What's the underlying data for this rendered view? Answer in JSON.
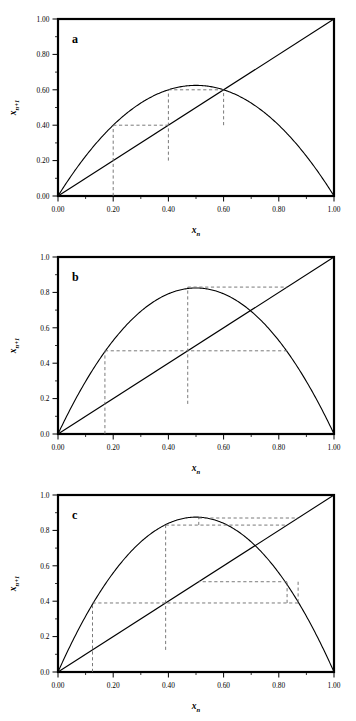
{
  "figure": {
    "type": "logistic-map-cobweb-figure",
    "panel_count": 3,
    "background": "#ffffff",
    "line_color": "#000000",
    "dash_color": "#6b6b6b"
  },
  "axes": {
    "x_title": "x",
    "x_sub": "n",
    "y_title": "x",
    "y_sub": "n+1",
    "xlim": [
      0,
      1
    ],
    "ylim": [
      0,
      1
    ],
    "x_ticks": [
      0,
      0.2,
      0.4,
      0.6,
      0.8,
      1
    ],
    "x_tick_labels": [
      "0.00",
      "0.20",
      "0.40",
      "0.60",
      "0.80",
      "1.00"
    ],
    "minor_ticks_per_interval": 2,
    "grid": false
  },
  "panels": [
    {
      "letter": "a",
      "y_tick_labels": [
        "0.00",
        "0.20",
        "0.40",
        "0.60",
        "0.80",
        "1.00"
      ],
      "y_ticks": [
        0,
        0.2,
        0.4,
        0.6,
        0.8,
        1
      ],
      "r": 2.5,
      "peak": 0.625,
      "fixed_point": 0.6,
      "x0": 0.2,
      "orbit": [
        0.2,
        0.4,
        0.6,
        0.6
      ],
      "behavior": "convergence to fixed point"
    },
    {
      "letter": "b",
      "y_tick_labels": [
        "0.0",
        "0.2",
        "0.4",
        "0.6",
        "0.8",
        "1.0"
      ],
      "y_ticks": [
        0,
        0.2,
        0.4,
        0.6,
        0.8,
        1
      ],
      "r": 3.3,
      "peak": 0.825,
      "fixed_point": 0.697,
      "x0": 0.17,
      "orbit": [
        0.17,
        0.47,
        0.83,
        0.47
      ],
      "behavior": "period-2 cycle"
    },
    {
      "letter": "c",
      "y_tick_labels": [
        "0.0",
        "0.2",
        "0.4",
        "0.6",
        "0.8",
        "1.0"
      ],
      "y_ticks": [
        0,
        0.2,
        0.4,
        0.6,
        0.8,
        1
      ],
      "r": 3.5,
      "peak": 0.875,
      "fixed_point": 0.714,
      "x0": 0.125,
      "orbit": [
        0.125,
        0.39,
        0.83,
        0.51,
        0.87,
        0.39
      ],
      "behavior": "period-4 cycle"
    }
  ],
  "chart_data": {
    "type": "line",
    "title": "",
    "xlabel": "x_n",
    "ylabel": "x_n+1",
    "xlim": [
      0,
      1
    ],
    "ylim": [
      0,
      1
    ],
    "grid": false,
    "legend": "none",
    "subplots": [
      {
        "label": "a",
        "r": 2.5,
        "series": [
          {
            "name": "logistic map f(x)=2.5x(1-x)",
            "kind": "parabola",
            "peak_x": 0.5,
            "peak_y": 0.625
          },
          {
            "name": "identity y=x",
            "kind": "diagonal",
            "x": [
              0,
              1
            ],
            "y": [
              0,
              1
            ]
          },
          {
            "name": "cobweb",
            "kind": "dashed-staircase",
            "x_sequence": [
              0.2,
              0.4,
              0.6
            ],
            "y_sequence": [
              0.4,
              0.6,
              0.6
            ]
          }
        ],
        "x_tick_labels": [
          "0.00",
          "0.20",
          "0.40",
          "0.60",
          "0.80",
          "1.00"
        ],
        "y_tick_labels": [
          "0.00",
          "0.20",
          "0.40",
          "0.60",
          "0.80",
          "1.00"
        ]
      },
      {
        "label": "b",
        "r": 3.3,
        "series": [
          {
            "name": "logistic map f(x)=3.3x(1-x)",
            "kind": "parabola",
            "peak_x": 0.5,
            "peak_y": 0.825
          },
          {
            "name": "identity y=x",
            "kind": "diagonal",
            "x": [
              0,
              1
            ],
            "y": [
              0,
              1
            ]
          },
          {
            "name": "cobweb",
            "kind": "dashed-staircase",
            "x_sequence": [
              0.17,
              0.47,
              0.83,
              0.47
            ],
            "y_sequence": [
              0.47,
              0.83,
              0.47,
              0.83
            ]
          }
        ],
        "x_tick_labels": [
          "0.00",
          "0.20",
          "0.40",
          "0.60",
          "0.80",
          "1.00"
        ],
        "y_tick_labels": [
          "0.0",
          "0.2",
          "0.4",
          "0.6",
          "0.8",
          "1.0"
        ]
      },
      {
        "label": "c",
        "r": 3.5,
        "series": [
          {
            "name": "logistic map f(x)=3.5x(1-x)",
            "kind": "parabola",
            "peak_x": 0.5,
            "peak_y": 0.875
          },
          {
            "name": "identity y=x",
            "kind": "diagonal",
            "x": [
              0,
              1
            ],
            "y": [
              0,
              1
            ]
          },
          {
            "name": "cobweb",
            "kind": "dashed-staircase",
            "x_sequence": [
              0.125,
              0.39,
              0.83,
              0.51,
              0.87,
              0.39
            ],
            "y_sequence": [
              0.39,
              0.83,
              0.51,
              0.87,
              0.39,
              0.83
            ]
          }
        ],
        "x_tick_labels": [
          "0.00",
          "0.20",
          "0.40",
          "0.60",
          "0.80",
          "1.00"
        ],
        "y_tick_labels": [
          "0.0",
          "0.2",
          "0.4",
          "0.6",
          "0.8",
          "1.0"
        ]
      }
    ]
  }
}
